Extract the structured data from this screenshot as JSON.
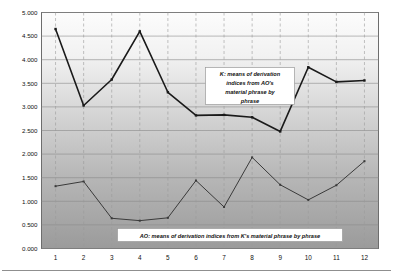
{
  "chart_data": {
    "type": "line",
    "title": "",
    "xlabel": "",
    "ylabel": "",
    "categories": [
      "1",
      "2",
      "3",
      "4",
      "5",
      "6",
      "7",
      "8",
      "9",
      "10",
      "11",
      "12"
    ],
    "x": [
      1,
      2,
      3,
      4,
      5,
      6,
      7,
      8,
      9,
      10,
      11,
      12
    ],
    "ylim": [
      0.0,
      5.0
    ],
    "xlim": [
      0.5,
      12.5
    ],
    "y_ticks": [
      "0.000",
      "0.500",
      "1.000",
      "1.500",
      "2.000",
      "2.500",
      "3.000",
      "3.500",
      "4.000",
      "4.500",
      "5.000"
    ],
    "y_tick_values": [
      0.0,
      0.5,
      1.0,
      1.5,
      2.0,
      2.5,
      3.0,
      3.5,
      4.0,
      4.5,
      5.0
    ],
    "grid": {
      "horizontal": true,
      "vertical": true,
      "vertical_style": "dashed",
      "horizontal_color": "#8a8a8a",
      "vertical_color": "#9a9a9a"
    },
    "legend_position": "inside-annotations",
    "series": [
      {
        "name": "K: means of derivation indices from AO's material phrase by phrase",
        "short_name": "K",
        "color": "#1a1a1a",
        "line_width": 1.6,
        "marker": "square",
        "values": [
          4.65,
          3.03,
          3.58,
          4.6,
          3.31,
          2.82,
          2.83,
          2.78,
          2.48,
          3.84,
          3.53,
          3.56
        ]
      },
      {
        "name": "AO: means of derivation indices from K's material phrase by phrase",
        "short_name": "AO",
        "color": "#3a3a3a",
        "line_width": 1.0,
        "marker": "square",
        "values": [
          1.32,
          1.42,
          0.64,
          0.59,
          0.65,
          1.44,
          0.88,
          1.93,
          1.35,
          1.03,
          1.34,
          1.85
        ]
      }
    ],
    "annotations": [
      {
        "id": "annotation-k",
        "lines": [
          "K:  means of derivation",
          "indices from AO's",
          "material phrase by",
          "phrase"
        ],
        "align": "center",
        "box": true
      },
      {
        "id": "annotation-ao",
        "lines": [
          "AO:  means of derivation indices from K's material phrase by phrase"
        ],
        "align": "center",
        "box": true
      }
    ],
    "plot_background": {
      "type": "vertical-gradient",
      "from": "#fbfbfb",
      "to": "#9d9d9d"
    },
    "frame_color": "#6d6d6d"
  }
}
